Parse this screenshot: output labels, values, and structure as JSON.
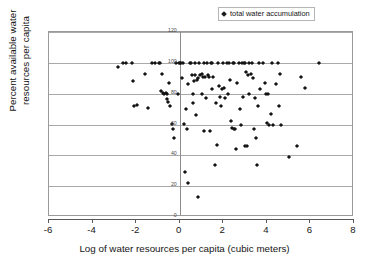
{
  "chart_data": {
    "type": "scatter",
    "title": "",
    "xlabel": "Log of water resources per capita (cubic meters)",
    "ylabel_line1": "Percent available water",
    "ylabel_line2": "resources per capita",
    "xlim": [
      -6,
      8
    ],
    "ylim": [
      0,
      120
    ],
    "xticks": [
      "-6",
      "-4",
      "-2",
      "0",
      "2",
      "4",
      "6",
      "8"
    ],
    "xtick_values": [
      -6,
      -4,
      -2,
      0,
      2,
      4,
      6,
      8
    ],
    "yticks": [
      "120",
      "100",
      "80",
      "60",
      "40",
      "20",
      "0"
    ],
    "ytick_values": [
      120,
      100,
      80,
      60,
      40,
      20,
      0
    ],
    "grid": "horizontal",
    "legend_position": "top-right",
    "marker": "diamond",
    "marker_color": "#141414",
    "gridline_color": "#a9a9a9",
    "series": [
      {
        "name": "total water accumulation",
        "points": [
          [
            -2.85,
            97.5
          ],
          [
            -2.6,
            100
          ],
          [
            -2.45,
            100
          ],
          [
            -2.2,
            100
          ],
          [
            -2.15,
            88
          ],
          [
            -2.1,
            72
          ],
          [
            -1.95,
            72.5
          ],
          [
            -1.6,
            93
          ],
          [
            -1.45,
            71
          ],
          [
            -1.25,
            100
          ],
          [
            -1.15,
            100
          ],
          [
            -0.95,
            100
          ],
          [
            -0.9,
            100
          ],
          [
            -0.85,
            82
          ],
          [
            -0.8,
            93
          ],
          [
            -0.75,
            80.5
          ],
          [
            -0.7,
            80
          ],
          [
            -0.65,
            80.5
          ],
          [
            -0.6,
            80
          ],
          [
            -0.6,
            76.5
          ],
          [
            -0.55,
            74.5
          ],
          [
            -0.5,
            87
          ],
          [
            -0.45,
            72
          ],
          [
            -0.35,
            60.5
          ],
          [
            -0.3,
            57
          ],
          [
            -0.25,
            51
          ],
          [
            -0.15,
            100
          ],
          [
            -0.1,
            80
          ],
          [
            -0.05,
            100
          ],
          [
            0.0,
            100
          ],
          [
            0.05,
            100
          ],
          [
            0.1,
            90
          ],
          [
            0.15,
            100
          ],
          [
            0.2,
            60.5
          ],
          [
            0.25,
            29
          ],
          [
            0.3,
            70
          ],
          [
            0.35,
            57
          ],
          [
            0.4,
            86
          ],
          [
            0.4,
            22
          ],
          [
            0.45,
            100
          ],
          [
            0.5,
            100
          ],
          [
            0.55,
            92
          ],
          [
            0.6,
            80
          ],
          [
            0.6,
            74
          ],
          [
            0.65,
            88
          ],
          [
            0.7,
            100
          ],
          [
            0.7,
            92
          ],
          [
            0.75,
            66
          ],
          [
            0.8,
            89
          ],
          [
            0.85,
            90
          ],
          [
            0.85,
            13
          ],
          [
            0.9,
            100
          ],
          [
            0.95,
            92
          ],
          [
            1.0,
            93
          ],
          [
            1.0,
            80
          ],
          [
            1.05,
            91
          ],
          [
            1.1,
            100
          ],
          [
            1.1,
            56
          ],
          [
            1.15,
            91
          ],
          [
            1.2,
            77
          ],
          [
            1.25,
            100
          ],
          [
            1.3,
            92
          ],
          [
            1.35,
            91
          ],
          [
            1.4,
            56
          ],
          [
            1.45,
            100
          ],
          [
            1.5,
            100
          ],
          [
            1.5,
            83
          ],
          [
            1.55,
            91
          ],
          [
            1.6,
            34
          ],
          [
            1.65,
            74
          ],
          [
            1.7,
            47
          ],
          [
            1.75,
            100
          ],
          [
            1.8,
            85
          ],
          [
            1.85,
            78
          ],
          [
            1.9,
            72
          ],
          [
            1.95,
            83
          ],
          [
            2.0,
            100
          ],
          [
            2.05,
            84
          ],
          [
            2.1,
            77
          ],
          [
            2.15,
            100
          ],
          [
            2.2,
            80
          ],
          [
            2.25,
            100
          ],
          [
            2.3,
            89
          ],
          [
            2.35,
            62
          ],
          [
            2.4,
            58
          ],
          [
            2.45,
            100
          ],
          [
            2.5,
            100
          ],
          [
            2.5,
            57
          ],
          [
            2.55,
            57
          ],
          [
            2.6,
            44
          ],
          [
            2.65,
            87
          ],
          [
            2.7,
            100
          ],
          [
            2.75,
            70
          ],
          [
            2.8,
            60
          ],
          [
            2.85,
            100
          ],
          [
            2.9,
            78
          ],
          [
            2.95,
            100
          ],
          [
            3.0,
            100
          ],
          [
            3.0,
            46
          ],
          [
            3.05,
            94
          ],
          [
            3.1,
            46
          ],
          [
            3.15,
            92
          ],
          [
            3.2,
            100
          ],
          [
            3.2,
            80
          ],
          [
            3.25,
            93
          ],
          [
            3.3,
            100
          ],
          [
            3.35,
            90
          ],
          [
            3.4,
            57
          ],
          [
            3.45,
            77
          ],
          [
            3.5,
            51
          ],
          [
            3.55,
            34
          ],
          [
            3.6,
            72
          ],
          [
            3.65,
            100
          ],
          [
            3.7,
            83
          ],
          [
            3.8,
            100
          ],
          [
            3.9,
            87
          ],
          [
            3.95,
            80
          ],
          [
            4.0,
            61
          ],
          [
            4.05,
            80
          ],
          [
            4.1,
            60
          ],
          [
            4.2,
            67
          ],
          [
            4.25,
            100
          ],
          [
            4.3,
            60
          ],
          [
            4.4,
            86
          ],
          [
            4.5,
            100
          ],
          [
            4.55,
            72
          ],
          [
            4.6,
            93
          ],
          [
            4.65,
            60
          ],
          [
            5.0,
            39
          ],
          [
            5.4,
            46
          ],
          [
            5.55,
            91
          ],
          [
            5.75,
            84
          ],
          [
            6.4,
            100
          ]
        ]
      }
    ]
  },
  "legend": {
    "entries": [
      {
        "label": "total water accumulation"
      }
    ]
  }
}
